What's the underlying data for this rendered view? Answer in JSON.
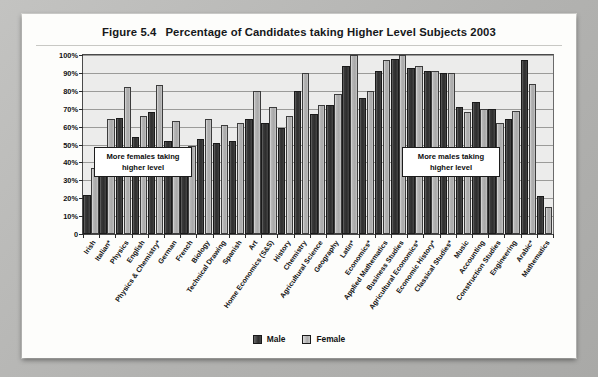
{
  "figure": {
    "number": "Figure 5.4",
    "title": "Percentage of Candidates taking Higher Level Subjects 2003"
  },
  "annotations": {
    "females": "More females taking\nhigher level",
    "males": "More males taking\nhigher level"
  },
  "legend": {
    "male_label": "Male",
    "female_label": "Female"
  },
  "chart_data": {
    "type": "bar",
    "title": "Percentage of Candidates taking Higher Level Subjects 2003",
    "xlabel": "",
    "ylabel": "",
    "ylim": [
      0,
      100
    ],
    "ytick_labels": [
      "0",
      "10%",
      "20%",
      "30%",
      "40%",
      "50%",
      "60%",
      "70%",
      "80%",
      "90%",
      "100%"
    ],
    "ytick_values": [
      0,
      10,
      20,
      30,
      40,
      50,
      60,
      70,
      80,
      90,
      100
    ],
    "grid": true,
    "legend_position": "bottom",
    "categories": [
      "Irish",
      "Italian*",
      "Physics",
      "English",
      "Physics & Chemistry*",
      "German",
      "French",
      "Biology",
      "Technical Drawing",
      "Spanish",
      "Art",
      "Home Economics (S&S)",
      "History",
      "Chemistry",
      "Agricultural Science",
      "Geography",
      "Latin*",
      "Economics*",
      "Applied Mathematics",
      "Business Studies",
      "Agricultural Economics*",
      "Economic History*",
      "Classical Studies*",
      "Music",
      "Accounting",
      "Construction Studies",
      "Engineering",
      "Arabic*",
      "Mathematics"
    ],
    "series": [
      {
        "name": "Male",
        "values": [
          22,
          45,
          65,
          54,
          68,
          52,
          41,
          53,
          51,
          52,
          64,
          62,
          59,
          80,
          67,
          72,
          94,
          76,
          91,
          98,
          93,
          91,
          90,
          71,
          74,
          70,
          64,
          97,
          21
        ]
      },
      {
        "name": "Female",
        "values": [
          37,
          64,
          82,
          66,
          83,
          63,
          49,
          64,
          61,
          62,
          80,
          71,
          66,
          90,
          72,
          78,
          100,
          80,
          97,
          100,
          94,
          91,
          90,
          68,
          70,
          62,
          69,
          84,
          15
        ]
      }
    ]
  }
}
